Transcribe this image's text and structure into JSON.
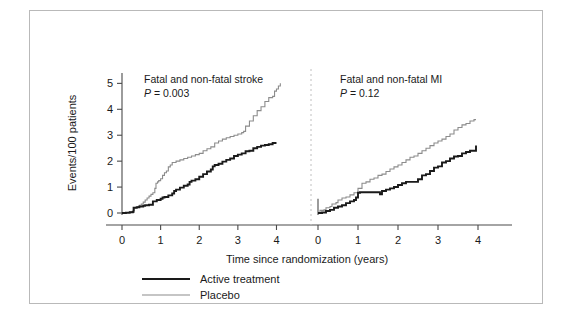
{
  "figure": {
    "axis_label_y": "Events/100 patients",
    "axis_label_x": "Time since randomization (years)",
    "border_color": "#b9b9b9",
    "divider_color": "#c0c0c0"
  },
  "legend": {
    "items": [
      {
        "label": "Active treatment",
        "color": "#1a1a1a"
      },
      {
        "label": "Placebo",
        "color": "#8c8c8c"
      }
    ]
  },
  "chart_data": {
    "type": "line",
    "title": "",
    "xlabel": "Time since randomization (years)",
    "ylabel": "Events/100 patients",
    "ylim": [
      0,
      5.4
    ],
    "yticks": [
      0,
      1,
      2,
      3,
      4,
      5
    ],
    "ytick_labels": [
      "0",
      "1",
      "2",
      "3",
      "4",
      "5"
    ],
    "grid": false,
    "legend_position": "bottom-left",
    "panels": [
      {
        "name": "stroke-panel",
        "title": "Fatal and non-fatal stroke",
        "p_label": "P",
        "p_equals": "=",
        "p_value": "0.003",
        "xlim": [
          0,
          4.35
        ],
        "xticks": [
          0,
          1,
          2,
          3,
          4
        ],
        "xtick_labels": [
          "0",
          "1",
          "2",
          "3",
          "4"
        ],
        "series": [
          {
            "name": "Placebo",
            "color": "#8c8c8c",
            "x": [
              0,
              0.1,
              0.2,
              0.3,
              0.32,
              0.4,
              0.45,
              0.5,
              0.55,
              0.6,
              0.65,
              0.7,
              0.75,
              0.8,
              0.85,
              0.88,
              0.92,
              0.95,
              1.0,
              1.05,
              1.1,
              1.15,
              1.2,
              1.25,
              1.3,
              1.4,
              1.5,
              1.6,
              1.7,
              1.8,
              1.9,
              2.0,
              2.1,
              2.2,
              2.3,
              2.4,
              2.5,
              2.6,
              2.7,
              2.8,
              2.9,
              3.0,
              3.1,
              3.15,
              3.2,
              3.3,
              3.4,
              3.5,
              3.6,
              3.7,
              3.8,
              3.9,
              3.95,
              4.0,
              4.05,
              4.1
            ],
            "y": [
              0,
              0.02,
              0.05,
              0.1,
              0.2,
              0.25,
              0.3,
              0.35,
              0.42,
              0.5,
              0.58,
              0.65,
              0.72,
              0.78,
              0.95,
              1.15,
              1.2,
              1.25,
              1.32,
              1.45,
              1.55,
              1.62,
              1.78,
              1.85,
              1.95,
              2.0,
              2.05,
              2.1,
              2.15,
              2.2,
              2.25,
              2.3,
              2.4,
              2.48,
              2.55,
              2.7,
              2.78,
              2.85,
              2.9,
              2.95,
              3.0,
              3.05,
              3.1,
              3.15,
              3.35,
              3.55,
              3.75,
              3.95,
              4.1,
              4.3,
              4.45,
              4.5,
              4.7,
              4.78,
              4.9,
              5.0
            ]
          },
          {
            "name": "Active treatment",
            "color": "#1a1a1a",
            "x": [
              0,
              0.1,
              0.2,
              0.28,
              0.3,
              0.38,
              0.45,
              0.55,
              0.6,
              0.7,
              0.8,
              0.9,
              1.0,
              1.05,
              1.1,
              1.2,
              1.3,
              1.35,
              1.4,
              1.5,
              1.6,
              1.7,
              1.75,
              1.8,
              1.9,
              2.0,
              2.1,
              2.2,
              2.3,
              2.35,
              2.4,
              2.5,
              2.6,
              2.7,
              2.8,
              2.9,
              3.0,
              3.1,
              3.2,
              3.3,
              3.4,
              3.5,
              3.6,
              3.7,
              3.8,
              3.9,
              4.0
            ],
            "y": [
              0,
              0.01,
              0.03,
              0.05,
              0.2,
              0.22,
              0.25,
              0.28,
              0.3,
              0.32,
              0.45,
              0.5,
              0.55,
              0.6,
              0.62,
              0.68,
              0.75,
              0.85,
              0.9,
              0.98,
              1.05,
              1.1,
              1.2,
              1.25,
              1.3,
              1.4,
              1.5,
              1.6,
              1.68,
              1.8,
              1.85,
              1.9,
              1.98,
              2.05,
              2.1,
              2.2,
              2.25,
              2.3,
              2.38,
              2.4,
              2.5,
              2.55,
              2.6,
              2.62,
              2.65,
              2.7,
              2.7
            ]
          }
        ]
      },
      {
        "name": "mi-panel",
        "title": "Fatal and non-fatal MI",
        "p_label": "P",
        "p_equals": "=",
        "p_value": "0.12",
        "xlim": [
          0,
          4.35
        ],
        "xticks": [
          0,
          1,
          2,
          3,
          4
        ],
        "xtick_labels": [
          "0",
          "1",
          "2",
          "3",
          "4"
        ],
        "series": [
          {
            "name": "Placebo",
            "color": "#8c8c8c",
            "x": [
              0,
              0.05,
              0.15,
              0.2,
              0.3,
              0.35,
              0.45,
              0.5,
              0.6,
              0.7,
              0.8,
              0.9,
              1.0,
              1.1,
              1.2,
              1.3,
              1.4,
              1.5,
              1.6,
              1.7,
              1.8,
              1.9,
              2.0,
              2.1,
              2.2,
              2.3,
              2.4,
              2.5,
              2.6,
              2.7,
              2.8,
              2.9,
              3.0,
              3.1,
              3.2,
              3.3,
              3.4,
              3.5,
              3.6,
              3.7,
              3.8,
              3.9,
              3.95
            ],
            "y": [
              0,
              0.1,
              0.12,
              0.2,
              0.25,
              0.35,
              0.4,
              0.5,
              0.58,
              0.62,
              0.7,
              0.78,
              0.95,
              1.15,
              1.2,
              1.3,
              1.35,
              1.45,
              1.5,
              1.6,
              1.7,
              1.78,
              1.85,
              1.95,
              2.05,
              2.15,
              2.2,
              2.3,
              2.4,
              2.5,
              2.6,
              2.7,
              2.78,
              2.85,
              2.95,
              3.05,
              3.2,
              3.3,
              3.4,
              3.45,
              3.55,
              3.6,
              3.6
            ]
          },
          {
            "name": "Active treatment",
            "color": "#1a1a1a",
            "x": [
              0,
              0.1,
              0.2,
              0.3,
              0.4,
              0.5,
              0.6,
              0.7,
              0.8,
              0.9,
              0.95,
              1.0,
              1.05,
              1.2,
              1.4,
              1.55,
              1.6,
              1.7,
              1.8,
              1.9,
              2.0,
              2.1,
              2.2,
              2.3,
              2.4,
              2.5,
              2.6,
              2.7,
              2.8,
              2.9,
              3.0,
              3.1,
              3.2,
              3.3,
              3.4,
              3.5,
              3.6,
              3.7,
              3.8,
              3.9,
              3.95
            ],
            "y": [
              0,
              0.02,
              0.08,
              0.12,
              0.2,
              0.25,
              0.3,
              0.38,
              0.45,
              0.5,
              0.6,
              0.78,
              0.8,
              0.8,
              0.8,
              0.72,
              0.85,
              0.9,
              0.95,
              1.0,
              1.08,
              1.15,
              1.2,
              1.2,
              1.2,
              1.3,
              1.45,
              1.5,
              1.62,
              1.75,
              1.8,
              1.95,
              2.0,
              2.1,
              2.18,
              2.2,
              2.3,
              2.35,
              2.4,
              2.4,
              2.6
            ]
          }
        ]
      }
    ]
  }
}
